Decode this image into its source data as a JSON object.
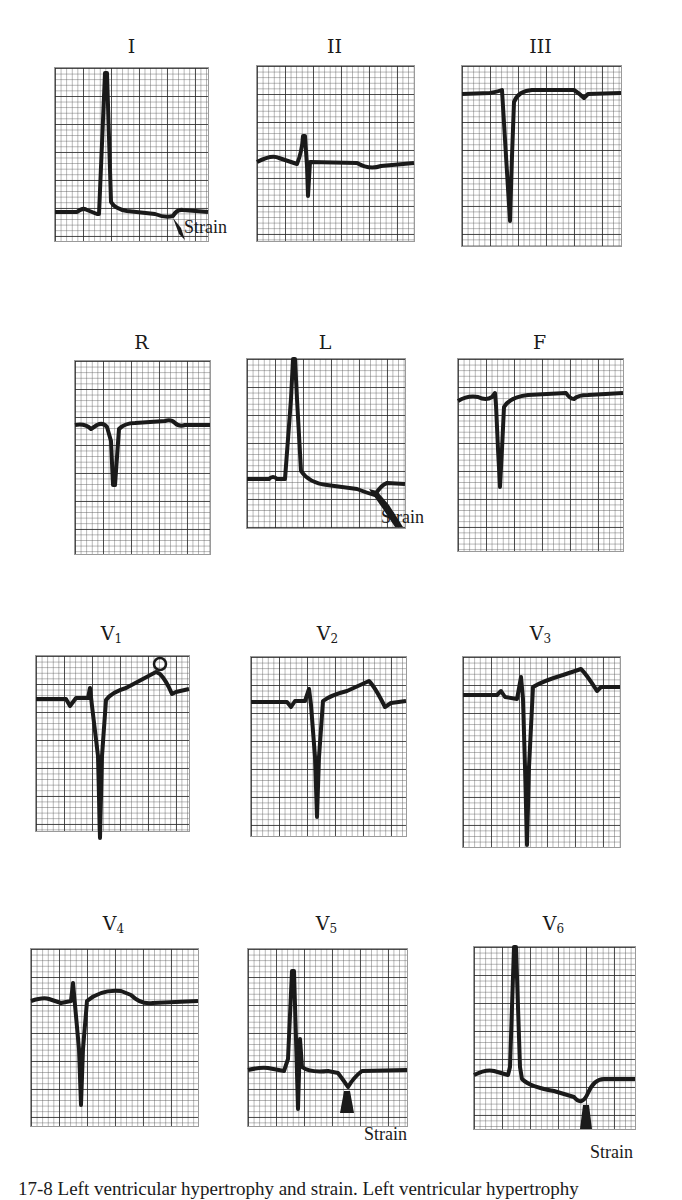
{
  "figure": {
    "caption": "17-8 Left ventricular hypertrophy and strain. Left ventricular hypertrophy",
    "annotation_label": "Strain",
    "leads": [
      {
        "id": "I",
        "label": "I",
        "sub": ""
      },
      {
        "id": "II",
        "label": "II",
        "sub": ""
      },
      {
        "id": "III",
        "label": "III",
        "sub": ""
      },
      {
        "id": "R",
        "label": "R",
        "sub": ""
      },
      {
        "id": "L",
        "label": "L",
        "sub": ""
      },
      {
        "id": "F",
        "label": "F",
        "sub": ""
      },
      {
        "id": "V1",
        "label": "V",
        "sub": "1"
      },
      {
        "id": "V2",
        "label": "V",
        "sub": "2"
      },
      {
        "id": "V3",
        "label": "V",
        "sub": "3"
      },
      {
        "id": "V4",
        "label": "V",
        "sub": "4"
      },
      {
        "id": "V5",
        "label": "V",
        "sub": "5"
      },
      {
        "id": "V6",
        "label": "V",
        "sub": "6"
      }
    ],
    "strain_annotations": [
      {
        "lead": "I",
        "label": "Strain"
      },
      {
        "lead": "L",
        "label": "Strain"
      },
      {
        "lead": "V5",
        "label": "Strain"
      },
      {
        "lead": "V6",
        "label": "Strain"
      }
    ],
    "colors": {
      "trace": "#1a1a1a",
      "grid_major": "#3a3a3a",
      "grid_minor": "#8a8a8a",
      "background": "#ffffff"
    }
  }
}
